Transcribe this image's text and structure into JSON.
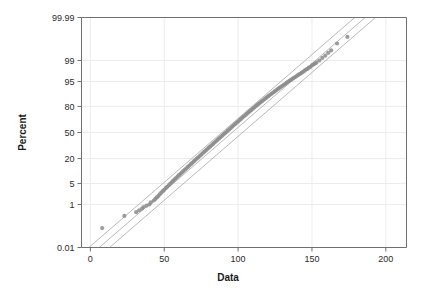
{
  "chart_data": {
    "type": "scatter",
    "title": "",
    "subtitle": "",
    "xlabel": "Data",
    "ylabel": "Percent",
    "xlim": [
      -6,
      214
    ],
    "ylim_percent": [
      0.01,
      99.99
    ],
    "grid": true,
    "legend": false,
    "legend_position": "none",
    "x_ticks": [
      0,
      50,
      100,
      150,
      200
    ],
    "x_tick_labels": [
      "0",
      "50",
      "100",
      "150",
      "200"
    ],
    "y_ticks": [
      0.01,
      1,
      5,
      20,
      50,
      80,
      95,
      99,
      99.99
    ],
    "y_tick_labels": [
      "0.01",
      "1",
      "5",
      "20",
      "50",
      "80",
      "95",
      "99",
      "99.99"
    ],
    "point_color": "#8c8c8c",
    "line_color": "#a8a8a8",
    "grid_color": "#ececec",
    "axis_color": "#707070",
    "fit_line": {
      "name": "distribution fit",
      "x": [
        6,
        186
      ],
      "percent": [
        0.01,
        99.99
      ]
    },
    "confidence_bands": [
      {
        "name": "lower bound",
        "x_offset": -7
      },
      {
        "name": "upper bound",
        "x_offset": 7
      }
    ],
    "series": [
      {
        "name": "observed data",
        "x": [
          8,
          23,
          31,
          33,
          35,
          36,
          38,
          40,
          41,
          43,
          44,
          45,
          46,
          47,
          48,
          49,
          50,
          51,
          52,
          53,
          54,
          55,
          56,
          57,
          58,
          59,
          60,
          61,
          62,
          63,
          64,
          65,
          66,
          67,
          68,
          69,
          70,
          71,
          72,
          73,
          74,
          75,
          76,
          77,
          78,
          79,
          80,
          81,
          82,
          83,
          84,
          85,
          86,
          87,
          88,
          89,
          90,
          91,
          92,
          93,
          94,
          95,
          96,
          97,
          98,
          99,
          100,
          101,
          102,
          103,
          104,
          105,
          106,
          107,
          108,
          109,
          110,
          111,
          112,
          113,
          114,
          115,
          116,
          117,
          118,
          119,
          120,
          121,
          122,
          123,
          124,
          125,
          126,
          127,
          128,
          129,
          130,
          131,
          132,
          133,
          134,
          135,
          136,
          137,
          138,
          139,
          140,
          141,
          142,
          143,
          144,
          145,
          146,
          147,
          148,
          149,
          150,
          151,
          152,
          153,
          155,
          157,
          159,
          161,
          163,
          167,
          174
        ],
        "percent": [
          0.1,
          0.35,
          0.5,
          0.6,
          0.7,
          0.8,
          0.9,
          1.0,
          1.2,
          1.4,
          1.6,
          1.8,
          2.0,
          2.3,
          2.6,
          2.9,
          3.2,
          3.6,
          4.0,
          4.4,
          4.9,
          5.4,
          5.9,
          6.5,
          7.1,
          7.7,
          8.4,
          9.1,
          9.9,
          10.7,
          11.5,
          12.4,
          13.3,
          14.3,
          15.3,
          16.4,
          17.5,
          18.7,
          19.9,
          21.1,
          22.4,
          23.7,
          25.1,
          26.5,
          27.9,
          29.4,
          30.9,
          32.4,
          34.0,
          35.6,
          37.2,
          38.8,
          40.5,
          42.1,
          43.8,
          45.5,
          47.2,
          48.9,
          50.6,
          52.3,
          54.0,
          55.7,
          57.4,
          59.1,
          60.7,
          62.3,
          63.9,
          65.5,
          67.0,
          68.5,
          70.0,
          71.4,
          72.8,
          74.1,
          75.4,
          76.7,
          77.9,
          79.1,
          80.2,
          81.3,
          82.3,
          83.3,
          84.2,
          85.1,
          86.0,
          86.8,
          87.6,
          88.3,
          89.0,
          89.7,
          90.3,
          90.9,
          91.5,
          92.0,
          92.5,
          93.0,
          93.4,
          93.8,
          94.2,
          94.6,
          95.0,
          95.3,
          95.6,
          95.9,
          96.2,
          96.4,
          96.7,
          96.9,
          97.1,
          97.3,
          97.5,
          97.7,
          97.9,
          98.0,
          98.2,
          98.3,
          98.5,
          98.6,
          98.7,
          98.8,
          99.0,
          99.2,
          99.35,
          99.5,
          99.6,
          99.8,
          99.9
        ]
      }
    ]
  },
  "axes": {
    "x_title": "Data",
    "y_title": "Percent"
  }
}
